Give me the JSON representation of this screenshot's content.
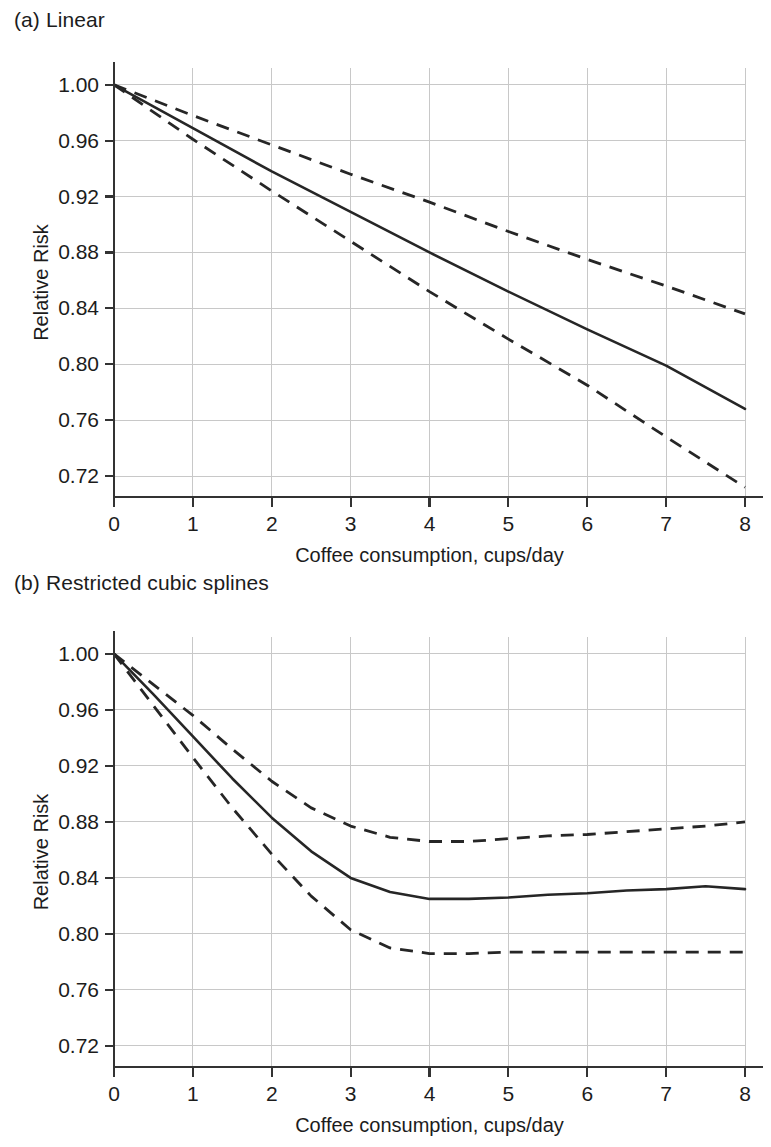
{
  "figure": {
    "panels": [
      {
        "id": "a",
        "title": "(a) Linear",
        "xlabel": "Coffee consumption, cups/day",
        "ylabel": "Relative Risk"
      },
      {
        "id": "b",
        "title": "(b) Restricted cubic splines",
        "xlabel": "Coffee consumption, cups/day",
        "ylabel": "Relative Risk"
      }
    ]
  },
  "chart_data": [
    {
      "type": "line",
      "title": "(a) Linear",
      "xlabel": "Coffee consumption, cups/day",
      "ylabel": "Relative Risk",
      "xlim": [
        0,
        8
      ],
      "ylim": [
        0.705,
        1.012
      ],
      "xticks": [
        0,
        1,
        2,
        3,
        4,
        5,
        6,
        7,
        8
      ],
      "xticklabels": [
        "0",
        "1",
        "2",
        "3",
        "4",
        "5",
        "6",
        "7",
        "8"
      ],
      "yticks": [
        0.72,
        0.76,
        0.8,
        0.84,
        0.88,
        0.92,
        0.96,
        1.0
      ],
      "yticklabels": [
        "0.72",
        "0.76",
        "0.80",
        "0.84",
        "0.88",
        "0.92",
        "0.96",
        "1.00"
      ],
      "grid": true,
      "legend": "none",
      "x": [
        0,
        1,
        2,
        3,
        4,
        5,
        6,
        7,
        8
      ],
      "series": [
        {
          "name": "Upper 95% CI",
          "style": "dashed",
          "values": [
            1.0,
            0.978,
            0.957,
            0.936,
            0.916,
            0.895,
            0.875,
            0.856,
            0.836
          ]
        },
        {
          "name": "Relative risk (linear)",
          "style": "solid",
          "values": [
            1.0,
            0.969,
            0.938,
            0.909,
            0.88,
            0.852,
            0.825,
            0.799,
            0.768
          ]
        },
        {
          "name": "Lower 95% CI",
          "style": "dashed",
          "values": [
            1.0,
            0.961,
            0.924,
            0.888,
            0.852,
            0.818,
            0.785,
            0.748,
            0.712
          ]
        }
      ]
    },
    {
      "type": "line",
      "title": "(b) Restricted cubic splines",
      "xlabel": "Coffee consumption, cups/day",
      "ylabel": "Relative Risk",
      "xlim": [
        0,
        8
      ],
      "ylim": [
        0.705,
        1.012
      ],
      "xticks": [
        0,
        1,
        2,
        3,
        4,
        5,
        6,
        7,
        8
      ],
      "xticklabels": [
        "0",
        "1",
        "2",
        "3",
        "4",
        "5",
        "6",
        "7",
        "8"
      ],
      "yticks": [
        0.72,
        0.76,
        0.8,
        0.84,
        0.88,
        0.92,
        0.96,
        1.0
      ],
      "yticklabels": [
        "0.72",
        "0.76",
        "0.80",
        "0.84",
        "0.88",
        "0.92",
        "0.96",
        "1.00"
      ],
      "grid": true,
      "legend": "none",
      "x": [
        0,
        0.5,
        1,
        1.5,
        2,
        2.5,
        3,
        3.5,
        4,
        4.5,
        5,
        5.5,
        6,
        6.5,
        7,
        7.5,
        8
      ],
      "series": [
        {
          "name": "Upper 95% CI",
          "style": "dashed",
          "values": [
            1.0,
            0.978,
            0.956,
            0.932,
            0.909,
            0.89,
            0.877,
            0.869,
            0.866,
            0.866,
            0.868,
            0.87,
            0.871,
            0.873,
            0.875,
            0.877,
            0.88
          ]
        },
        {
          "name": "Relative risk (spline)",
          "style": "solid",
          "values": [
            1.0,
            0.971,
            0.941,
            0.911,
            0.883,
            0.859,
            0.84,
            0.83,
            0.825,
            0.825,
            0.826,
            0.828,
            0.829,
            0.831,
            0.832,
            0.834,
            0.832
          ]
        },
        {
          "name": "Lower 95% CI",
          "style": "dashed",
          "values": [
            1.0,
            0.963,
            0.926,
            0.89,
            0.857,
            0.827,
            0.803,
            0.79,
            0.786,
            0.786,
            0.787,
            0.787,
            0.787,
            0.787,
            0.787,
            0.787,
            0.787
          ]
        }
      ]
    }
  ]
}
